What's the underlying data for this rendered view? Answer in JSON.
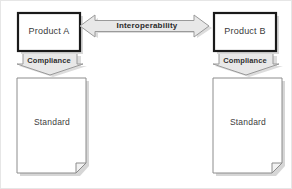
{
  "diagram": {
    "type": "block-diagram",
    "background_color": "#ffffff",
    "shape_fill": "#ffffff",
    "arrow_fill": "#e8e8e8",
    "arrow_stroke": "#9a9a9a",
    "box_stroke": "#1a1a1a",
    "doc_stroke": "#8c8c8c",
    "shadow_color": "#d0d0d0",
    "nodes": {
      "product_a": {
        "label": "Product A",
        "shape": "rectangle"
      },
      "product_b": {
        "label": "Product B",
        "shape": "rectangle"
      },
      "standard_a": {
        "label": "Standard",
        "shape": "document"
      },
      "standard_b": {
        "label": "Standard",
        "shape": "document"
      }
    },
    "connectors": {
      "interoperability": {
        "label": "Interoperability",
        "shape": "double-headed-horizontal-arrow",
        "from": "Product A",
        "to": "Product B"
      },
      "compliance_a": {
        "label": "Compliance",
        "shape": "down-block-arrow",
        "from": "Product A",
        "to": "Standard"
      },
      "compliance_b": {
        "label": "Compliance",
        "shape": "down-block-arrow",
        "from": "Product B",
        "to": "Standard"
      }
    }
  }
}
